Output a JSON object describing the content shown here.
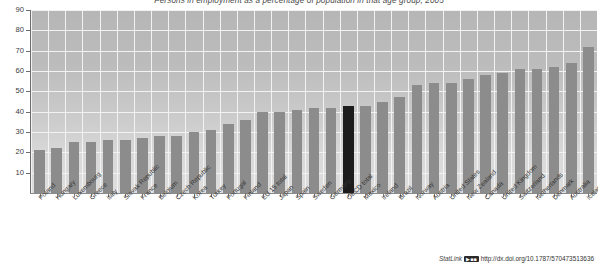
{
  "chart_data": {
    "type": "bar",
    "title": "Persons in employment as a percentage of population in that age group, 2005",
    "xlabel": "",
    "ylabel": "",
    "ylim": [
      0,
      90
    ],
    "yticks": [
      10,
      20,
      30,
      40,
      50,
      60,
      70,
      80,
      90
    ],
    "grid": true,
    "legend": "none",
    "highlight_category": "OECD total",
    "colors": {
      "bar": "#8c8c8c",
      "highlight_bar": "#1c1c1c",
      "plot_background": "#c4c4c4",
      "gridline": "#f2f2f2",
      "axis": "#6d6d6d",
      "text": "#333333"
    },
    "categories": [
      "Poland",
      "Hungary",
      "Luxembourg",
      "Greece",
      "Italy",
      "Slovak Republic",
      "France",
      "Belgium",
      "Czech Republic",
      "Korea",
      "Turkey",
      "Portugal",
      "Finland",
      "EU 15 total",
      "Japan",
      "Spain",
      "Sweden",
      "Germany",
      "OECD total",
      "Mexico",
      "Ireland",
      "Brazil",
      "Norway",
      "Austria",
      "United States",
      "New Zealand",
      "Canada",
      "United Kingdom",
      "Switzerland",
      "Netherlands",
      "Denmark",
      "Australia",
      "Iceland"
    ],
    "values": [
      21,
      22,
      25,
      25,
      26,
      26,
      27,
      28,
      28,
      30,
      31,
      34,
      36,
      40,
      40,
      41,
      42,
      42,
      43,
      43,
      45,
      47,
      53,
      54,
      54,
      56,
      58,
      59,
      61,
      61,
      62,
      64,
      72
    ]
  },
  "footer": {
    "statlink_word": "StatLink",
    "statlink_badge": "▶■■",
    "statlink_url": "http://dx.doi.org/10.1787/570473513636"
  }
}
